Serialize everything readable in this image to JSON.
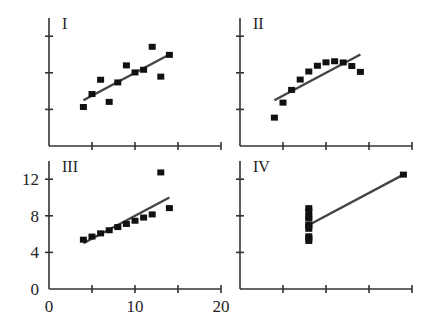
{
  "chart_data": {
    "type": "scatter",
    "layout": "2x2 grid, shared axes: x 0-20, y 0-14",
    "xlim": [
      0,
      20
    ],
    "ylim": [
      0,
      14
    ],
    "x_ticks": [
      0,
      10,
      20
    ],
    "x_minor_ticks": [
      5,
      15
    ],
    "y_ticks": [
      0,
      4,
      8,
      12
    ],
    "grid": false,
    "legend": null,
    "panels": [
      {
        "label": "I",
        "x": [
          10,
          8,
          13,
          9,
          11,
          14,
          6,
          4,
          12,
          7,
          5
        ],
        "y": [
          8.04,
          6.95,
          7.58,
          8.81,
          8.33,
          9.96,
          7.24,
          4.26,
          10.84,
          4.82,
          5.68
        ],
        "fit_line": {
          "x": [
            4,
            14
          ],
          "y": [
            5.0,
            10.0
          ]
        }
      },
      {
        "label": "II",
        "x": [
          10,
          8,
          13,
          9,
          11,
          14,
          6,
          4,
          12,
          7,
          5
        ],
        "y": [
          9.14,
          8.14,
          8.74,
          8.77,
          9.26,
          8.1,
          6.13,
          3.1,
          9.13,
          7.26,
          4.74
        ],
        "fit_line": {
          "x": [
            4,
            14
          ],
          "y": [
            5.0,
            10.0
          ]
        }
      },
      {
        "label": "III",
        "x": [
          10,
          8,
          13,
          9,
          11,
          14,
          6,
          4,
          12,
          7,
          5
        ],
        "y": [
          7.46,
          6.77,
          12.74,
          7.11,
          7.81,
          8.84,
          6.08,
          5.39,
          8.15,
          6.42,
          5.73
        ],
        "fit_line": {
          "x": [
            4,
            14
          ],
          "y": [
            5.0,
            10.0
          ]
        }
      },
      {
        "label": "IV",
        "x": [
          8,
          8,
          8,
          8,
          8,
          8,
          8,
          19,
          8,
          8,
          8
        ],
        "y": [
          6.58,
          5.76,
          7.71,
          8.84,
          8.47,
          7.04,
          5.25,
          12.5,
          5.56,
          7.91,
          6.89
        ],
        "fit_line": {
          "x": [
            8,
            19
          ],
          "y": [
            7.0,
            12.5
          ]
        }
      }
    ]
  },
  "labels": {
    "panel_1": "I",
    "panel_2": "II",
    "panel_3": "III",
    "panel_4": "IV",
    "y_0": "0",
    "y_4": "4",
    "y_8": "8",
    "y_12": "12",
    "x_0": "0",
    "x_10": "10",
    "x_20": "20"
  }
}
